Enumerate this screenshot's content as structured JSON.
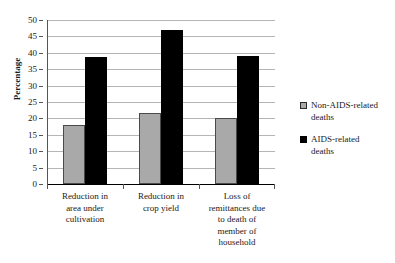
{
  "chart_data": {
    "type": "bar",
    "title": "",
    "xlabel": "",
    "ylabel": "Percentage",
    "ylim": [
      0,
      50
    ],
    "ytick_step": 5,
    "yticks": [
      "0",
      "5",
      "10",
      "15",
      "20",
      "25",
      "30",
      "35",
      "40",
      "45",
      "50"
    ],
    "grid": true,
    "legend_position": "right",
    "categories": [
      "Reduction in area under cultivation",
      "Reduction in crop yield",
      "Loss of remittances due to death of member of household"
    ],
    "category_lines": [
      [
        "Reduction in",
        "area under",
        "cultivation"
      ],
      [
        "Reduction in",
        "crop yield"
      ],
      [
        "Loss of",
        "remittances due",
        "to death of",
        "member of",
        "household"
      ]
    ],
    "series": [
      {
        "name": "Non-AIDS-related deaths",
        "name_lines": [
          "Non-AIDS-related",
          "deaths"
        ],
        "color": "#a9a9a9",
        "values": [
          18,
          21.5,
          20
        ]
      },
      {
        "name": "AIDS-related deaths",
        "name_lines": [
          "AIDS-related",
          "deaths"
        ],
        "color": "#000000",
        "values": [
          38.8,
          47,
          39
        ]
      }
    ]
  },
  "colors": {
    "background": "#ffffff",
    "gridline": "#b5b5b5",
    "axis": "#555555",
    "text": "#1a1a1a",
    "series_non_aids": "#a9a9a9",
    "series_aids": "#000000"
  }
}
